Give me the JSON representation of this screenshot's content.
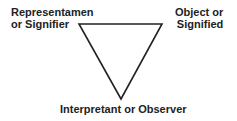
{
  "diagram": {
    "nodes": {
      "representamen": {
        "line1": "Representamen",
        "line2": "or Signifier"
      },
      "object": {
        "line1": "Object or",
        "line2": "Signified"
      },
      "interpretant": {
        "label": "Interpretant or Observer"
      }
    },
    "shape": "inverted-triangle",
    "colors": {
      "stroke": "#222222",
      "text": "#222222",
      "background": "#ffffff"
    }
  }
}
